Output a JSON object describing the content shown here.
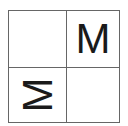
{
  "grid": {
    "rows": 2,
    "cols": 2,
    "line_color": "#666666",
    "cells": [
      {
        "row": 0,
        "col": 0,
        "text": "",
        "rotation_deg": 0
      },
      {
        "row": 0,
        "col": 1,
        "text": "M",
        "rotation_deg": 0
      },
      {
        "row": 1,
        "col": 0,
        "text": "M",
        "rotation_deg": -90
      },
      {
        "row": 1,
        "col": 1,
        "text": "",
        "rotation_deg": 0
      }
    ]
  }
}
